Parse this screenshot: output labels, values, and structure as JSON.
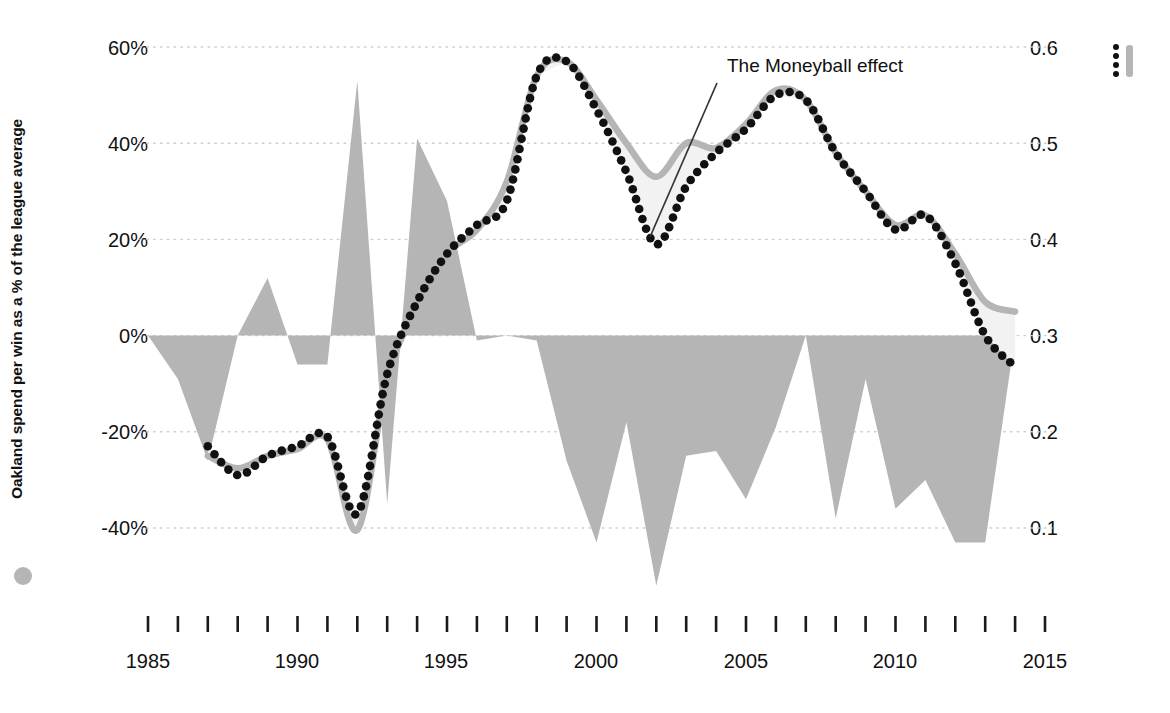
{
  "chart_data": {
    "type": "line",
    "title": "",
    "annotations": [
      {
        "text": "The Moneyball effect",
        "x": 2002.3,
        "y": 0.45,
        "label_x": 727,
        "label_y": 55
      }
    ],
    "left_axis": {
      "label": "Oakland  spend per win as a % of the league average",
      "ticks": [
        "60%",
        "40%",
        "20%",
        "0%",
        "-20%",
        "-40%"
      ],
      "tick_values": [
        60,
        40,
        20,
        0,
        -20,
        -40
      ],
      "ylim": [
        -50,
        70
      ],
      "legend_marker": "filled-circle",
      "color": "#b5b5b5"
    },
    "right_axis": {
      "label": "Correlation between payroll and wins (3-year average)",
      "ticks": [
        "0.6",
        "0.5",
        "0.4",
        "0.3",
        "0.2",
        "0.1"
      ],
      "tick_values": [
        0.6,
        0.5,
        0.4,
        0.3,
        0.2,
        0.1
      ],
      "ylim": [
        0.05,
        0.65
      ],
      "legend_marker": "dotted-line-and-bar",
      "colors": [
        "#111111",
        "#b5b5b5"
      ]
    },
    "xlabel": "",
    "xlim": [
      1985,
      2015
    ],
    "xticks_major": [
      1985,
      1990,
      1995,
      2000,
      2005,
      2010,
      2015
    ],
    "xticks_minor_step": 1,
    "grid": true,
    "legend_position": "axis-titles",
    "series": [
      {
        "name": "Oakland spend per win as a % of the league average",
        "axis": "left",
        "type": "area",
        "color": "#b5b5b5",
        "x": [
          1985,
          1986,
          1987,
          1988,
          1989,
          1990,
          1991,
          1992,
          1993,
          1994,
          1995,
          1996,
          1997,
          1998,
          1999,
          2000,
          2001,
          2002,
          2003,
          2004,
          2005,
          2006,
          2007,
          2008,
          2009,
          2010,
          2011,
          2012,
          2013,
          2014,
          2015
        ],
        "values": [
          0,
          -9,
          -26,
          0,
          12,
          -6,
          -6,
          53,
          -35,
          41,
          28,
          -1,
          0,
          -1,
          -26,
          -43,
          -18,
          -52,
          -25,
          -24,
          -34,
          -19,
          0,
          -38,
          -9,
          -36,
          -30,
          -43,
          -43,
          0,
          0
        ]
      },
      {
        "name": "Correlation between payroll and wins (3-year average) - smoothed",
        "axis": "right",
        "type": "line",
        "style": "solid",
        "color": "#b5b5b5",
        "x": [
          1987,
          1988,
          1989,
          1990,
          1991,
          1992,
          1993,
          1994,
          1995,
          1996,
          1997,
          1998,
          1999,
          2000,
          2001,
          2002,
          2003,
          2004,
          2005,
          2006,
          2007,
          2008,
          2009,
          2010,
          2011,
          2012,
          2013,
          2014
        ],
        "values": [
          0.175,
          0.162,
          0.175,
          0.182,
          0.192,
          0.098,
          0.255,
          0.33,
          0.385,
          0.41,
          0.46,
          0.57,
          0.585,
          0.545,
          0.5,
          0.465,
          0.5,
          0.495,
          0.52,
          0.555,
          0.545,
          0.49,
          0.45,
          0.415,
          0.425,
          0.385,
          0.335,
          0.325
        ]
      },
      {
        "name": "Correlation between payroll and wins (3-year average)",
        "axis": "right",
        "type": "line",
        "style": "dotted",
        "color": "#111111",
        "x": [
          1987,
          1988,
          1989,
          1990,
          1991,
          1992,
          1993,
          1994,
          1995,
          1996,
          1997,
          1998,
          1999,
          2000,
          2001,
          2002,
          2003,
          2004,
          2005,
          2006,
          2007,
          2008,
          2009,
          2010,
          2011,
          2012,
          2013,
          2014
        ],
        "values": [
          0.185,
          0.155,
          0.175,
          0.185,
          0.195,
          0.115,
          0.26,
          0.335,
          0.385,
          0.415,
          0.44,
          0.57,
          0.585,
          0.535,
          0.47,
          0.395,
          0.455,
          0.49,
          0.515,
          0.55,
          0.545,
          0.49,
          0.45,
          0.41,
          0.425,
          0.375,
          0.3,
          0.268
        ]
      }
    ]
  },
  "left_axis_title": "Oakland  spend per win as a % of the league average",
  "right_axis_title": "Correlation between payroll and wins (3-year average)",
  "annotation_text": "The Moneyball effect",
  "yticks_left": [
    "60%",
    "40%",
    "20%",
    "0%",
    "-20%",
    "-40%"
  ],
  "yticks_right": [
    "0.6",
    "0.5",
    "0.4",
    "0.3",
    "0.2",
    "0.1"
  ],
  "xticks": [
    "1985",
    "1990",
    "1995",
    "2000",
    "2005",
    "2010",
    "2015"
  ],
  "colors": {
    "area_gray": "#b5b5b5",
    "line_gray": "#b5b5b5",
    "dots_black": "#111111",
    "band_fill": "#f2f2f2",
    "grid": "#cfcfcf",
    "background": "#ffffff"
  }
}
